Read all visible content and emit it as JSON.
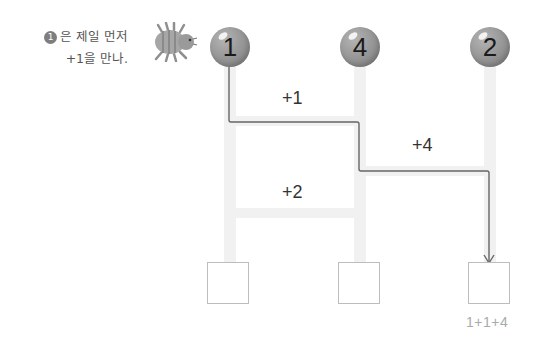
{
  "hint": {
    "badge": "1",
    "line1": "은 제일 먼저",
    "line2": "+1을 만나."
  },
  "columns": [
    {
      "start_value": "1"
    },
    {
      "start_value": "4"
    },
    {
      "start_value": "2"
    }
  ],
  "rungs": [
    {
      "label": "+1",
      "between": "1-2"
    },
    {
      "label": "+4",
      "between": "2-3"
    },
    {
      "label": "+2",
      "between": "1-2"
    }
  ],
  "answer_boxes": [
    {
      "value": ""
    },
    {
      "value": ""
    },
    {
      "value": ""
    }
  ],
  "path_hint": "1+1+4",
  "colors": {
    "ball": "#999999",
    "rail": "#f1f1f1",
    "path_line": "#666666",
    "box_border": "#bdbdbd"
  }
}
